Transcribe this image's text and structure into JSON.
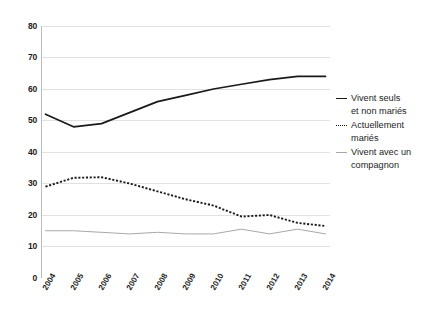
{
  "chart_data": {
    "type": "line",
    "title": "",
    "subtitle": "",
    "xlabel": "",
    "ylabel": "",
    "categories": [
      "2004",
      "2005",
      "2006",
      "2007",
      "2008",
      "2009",
      "2010",
      "2011",
      "2012",
      "2013",
      "2014"
    ],
    "ylim": [
      0,
      80
    ],
    "ytick_step": 10,
    "yticks": [
      "0",
      "10",
      "20",
      "30",
      "40",
      "50",
      "60",
      "70",
      "80"
    ],
    "grid": "horizontal",
    "legend_position": "right",
    "series": [
      {
        "name": "Vivent seuls et non mariés",
        "legend_line1": "Vivent seuls",
        "legend_line2": "et non mariés",
        "style": "solid",
        "color": "#1a1a1a",
        "values": [
          52,
          48,
          49,
          52.5,
          56,
          58,
          60,
          61.5,
          63,
          64,
          64
        ]
      },
      {
        "name": "Actuellement mariés",
        "legend_line1": "Actuellement",
        "legend_line2": "mariés",
        "style": "dotted",
        "color": "#1a1a1a",
        "values": [
          29,
          31.8,
          32,
          30,
          27.5,
          25,
          23,
          19.5,
          20,
          17.5,
          16.5
        ]
      },
      {
        "name": "Vivent avec un compagnon",
        "legend_line1": "Vivent avec un",
        "legend_line2": "compagnon",
        "style": "solid-thin",
        "color": "#a8a8a8",
        "values": [
          15,
          15,
          14.5,
          14,
          14.5,
          14,
          14,
          15.5,
          14,
          15.5,
          14
        ]
      }
    ],
    "gridline_color": "#d9d9d9",
    "axis_color": "#bdbdbd",
    "background": "#ffffff"
  }
}
